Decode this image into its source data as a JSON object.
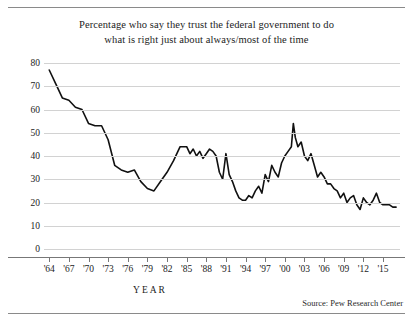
{
  "title": {
    "line1": "Percentage who say they trust the federal government to do",
    "line2": "what is right just about always/most of the time"
  },
  "axis": {
    "x_title": "YEAR",
    "y_ticks": [
      "80",
      "70",
      "60",
      "50",
      "40",
      "30",
      "20",
      "10",
      "0"
    ],
    "x_ticks": [
      "'64",
      "'67",
      "'70",
      "'73",
      "'76",
      "'79",
      "'82",
      "'85",
      "'88",
      "'91",
      "'94",
      "'97",
      "'00",
      "'03",
      "'06",
      "'09",
      "'12",
      "'15"
    ]
  },
  "source": "Source:  Pew Research Center",
  "colors": {
    "line": "#111111",
    "grid": "#d2d2d2",
    "axis": "#777777",
    "text": "#1c1c1c",
    "rule": "#8a8a8a",
    "background": "#ffffff"
  },
  "chart_data": {
    "type": "line",
    "title": "Percentage who say they trust the federal government to do what is right just about always/most of the time",
    "xlabel": "YEAR",
    "ylabel": "",
    "xlim": [
      1963,
      2017
    ],
    "ylim": [
      0,
      80
    ],
    "grid": true,
    "legend": null,
    "source": "Pew Research Center",
    "x": [
      1964,
      1966,
      1968,
      1970,
      1972,
      1974,
      1976,
      1978,
      1980,
      1982,
      1984,
      1985,
      1986,
      1987,
      1988,
      1989,
      1990,
      1991,
      1992,
      1993,
      1994,
      1995,
      1996,
      1997,
      1998,
      1999,
      2000,
      2001,
      2002,
      2003,
      2004,
      2005,
      2006,
      2007,
      2008,
      2009,
      2010,
      2011,
      2012,
      2013,
      2014,
      2015,
      2016,
      2017
    ],
    "values": [
      77,
      65,
      61,
      54,
      53,
      36,
      33,
      29,
      26,
      33,
      44,
      45,
      40,
      42,
      41,
      42,
      33,
      29,
      29,
      22,
      21,
      22,
      27,
      32,
      36,
      31,
      40,
      54,
      44,
      40,
      41,
      31,
      31,
      28,
      25,
      24,
      22,
      19,
      22,
      19,
      24,
      19,
      19,
      18
    ],
    "annotations": []
  },
  "series_path": {
    "description": "Dense polyline sample of the trust trend as plotted, in (year, percent) pairs",
    "points": [
      [
        1964,
        77
      ],
      [
        1965,
        71
      ],
      [
        1966,
        65
      ],
      [
        1967,
        64
      ],
      [
        1968,
        61
      ],
      [
        1969,
        60
      ],
      [
        1970,
        54
      ],
      [
        1971,
        53
      ],
      [
        1972,
        53
      ],
      [
        1973,
        47
      ],
      [
        1974,
        36
      ],
      [
        1975,
        34
      ],
      [
        1976,
        33
      ],
      [
        1977,
        34
      ],
      [
        1978,
        29
      ],
      [
        1979,
        26
      ],
      [
        1980,
        25
      ],
      [
        1981,
        29
      ],
      [
        1982,
        33
      ],
      [
        1983,
        38
      ],
      [
        1984,
        44
      ],
      [
        1985,
        44
      ],
      [
        1985.5,
        41
      ],
      [
        1986,
        43
      ],
      [
        1986.5,
        40
      ],
      [
        1987,
        42
      ],
      [
        1987.5,
        39
      ],
      [
        1988,
        41
      ],
      [
        1988.5,
        43
      ],
      [
        1989,
        42
      ],
      [
        1989.5,
        40
      ],
      [
        1990,
        33
      ],
      [
        1990.5,
        30
      ],
      [
        1991,
        41
      ],
      [
        1991.5,
        32
      ],
      [
        1992,
        29
      ],
      [
        1992.5,
        25
      ],
      [
        1993,
        22
      ],
      [
        1993.5,
        21
      ],
      [
        1994,
        21
      ],
      [
        1994.5,
        23
      ],
      [
        1995,
        22
      ],
      [
        1995.5,
        25
      ],
      [
        1996,
        27
      ],
      [
        1996.5,
        24
      ],
      [
        1997,
        32
      ],
      [
        1997.5,
        29
      ],
      [
        1998,
        36
      ],
      [
        1998.5,
        33
      ],
      [
        1999,
        31
      ],
      [
        1999.5,
        37
      ],
      [
        2000,
        40
      ],
      [
        2000.5,
        42
      ],
      [
        2001,
        44
      ],
      [
        2001.3,
        54
      ],
      [
        2001.6,
        48
      ],
      [
        2002,
        44
      ],
      [
        2002.5,
        46
      ],
      [
        2003,
        40
      ],
      [
        2003.5,
        38
      ],
      [
        2004,
        41
      ],
      [
        2004.5,
        36
      ],
      [
        2005,
        31
      ],
      [
        2005.5,
        33
      ],
      [
        2006,
        31
      ],
      [
        2006.5,
        28
      ],
      [
        2007,
        28
      ],
      [
        2007.5,
        26
      ],
      [
        2008,
        25
      ],
      [
        2008.5,
        22
      ],
      [
        2009,
        24
      ],
      [
        2009.5,
        20
      ],
      [
        2010,
        22
      ],
      [
        2010.5,
        23
      ],
      [
        2011,
        19
      ],
      [
        2011.5,
        17
      ],
      [
        2012,
        22
      ],
      [
        2012.5,
        20
      ],
      [
        2013,
        19
      ],
      [
        2013.5,
        21
      ],
      [
        2014,
        24
      ],
      [
        2014.5,
        20
      ],
      [
        2015,
        19
      ],
      [
        2015.5,
        19
      ],
      [
        2016,
        19
      ],
      [
        2016.5,
        18
      ],
      [
        2017,
        18
      ]
    ]
  }
}
